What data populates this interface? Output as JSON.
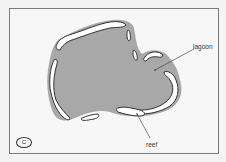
{
  "figure": {
    "panel_label": "C",
    "labels": {
      "lagoon": "lagoon",
      "reef": "reef"
    },
    "colors": {
      "lagoon_fill": "#a8a8a8",
      "reef_fill": "#ffffff",
      "reef_outline": "#333333",
      "frame": "#7a7a7a",
      "background": "#f7f7f7"
    }
  }
}
